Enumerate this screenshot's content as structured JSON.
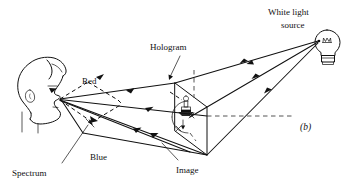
{
  "figure": {
    "caption": "(b)",
    "background_color": "#ffffff",
    "line_color": "#111111",
    "labels": {
      "white_light_line1": "White light",
      "white_light_line2": "source",
      "hologram": "Hologram",
      "red": "Red",
      "blue": "Blue",
      "spectrum": "Spectrum",
      "image": "Image"
    },
    "elements": {
      "observer_head": "head-profile",
      "light_bulb": "light-bulb",
      "hologram_plate": "hologram-plate",
      "reconstructed_object": "reconstructed-object",
      "optical_axis": "optical-axis-dashed"
    }
  }
}
